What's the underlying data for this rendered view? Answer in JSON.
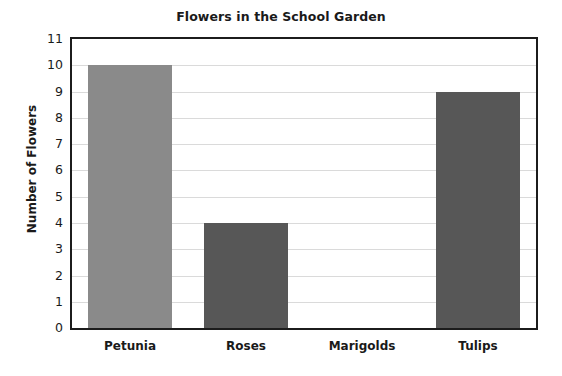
{
  "chart_data": {
    "type": "bar",
    "title": "Flowers in the School Garden",
    "xlabel": "",
    "ylabel": "Number of Flowers",
    "categories": [
      "Petunia",
      "Roses",
      "Marigolds",
      "Tulips"
    ],
    "values": [
      10,
      4,
      0,
      9
    ],
    "ylim": [
      0,
      11
    ],
    "ytick_labels": [
      "0",
      "1",
      "2",
      "3",
      "4",
      "5",
      "6",
      "7",
      "8",
      "9",
      "10",
      "11"
    ],
    "ytick_values": [
      0,
      1,
      2,
      3,
      4,
      5,
      6,
      7,
      8,
      9,
      10,
      11
    ],
    "grid": true,
    "legend": false,
    "bar_colors": [
      "#8a8a8a",
      "#575757",
      "#575757",
      "#575757"
    ],
    "axis_color": "#1c1c1c",
    "grid_color": "#dadada",
    "background": "#ffffff"
  }
}
